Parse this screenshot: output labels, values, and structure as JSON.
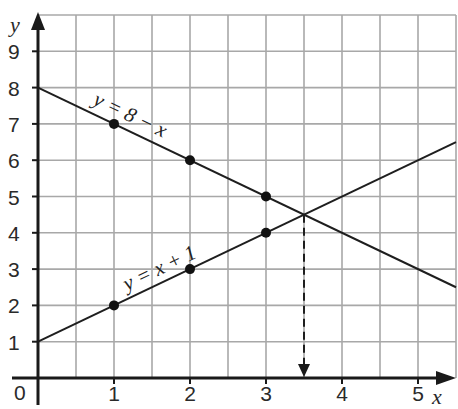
{
  "chart_data": {
    "type": "line",
    "title": "",
    "xlabel": "x",
    "ylabel": "y",
    "xlim": [
      0,
      5.5
    ],
    "ylim": [
      0,
      10
    ],
    "grid": true,
    "x_ticks": [
      "0",
      "1",
      "2",
      "3",
      "4",
      "5"
    ],
    "y_ticks": [
      "1",
      "2",
      "3",
      "4",
      "5",
      "6",
      "7",
      "8",
      "9"
    ],
    "series": [
      {
        "name": "y = 8 − x",
        "label": "y = 8 − x",
        "line": {
          "x": [
            0,
            5.5
          ],
          "y": [
            8,
            2.5
          ]
        },
        "points": [
          {
            "x": 1,
            "y": 7
          },
          {
            "x": 2,
            "y": 6
          },
          {
            "x": 3,
            "y": 5
          }
        ]
      },
      {
        "name": "y = x + 1",
        "label": "y = x + 1",
        "line": {
          "x": [
            0,
            5.5
          ],
          "y": [
            1,
            6.5
          ]
        },
        "points": [
          {
            "x": 1,
            "y": 2
          },
          {
            "x": 2,
            "y": 3
          },
          {
            "x": 3,
            "y": 4
          }
        ]
      }
    ],
    "annotations": [
      {
        "type": "intersection",
        "x": 3.5,
        "y": 4.5
      },
      {
        "type": "dashed-arrow",
        "from": {
          "x": 3.5,
          "y": 4.5
        },
        "to": {
          "x": 3.5,
          "y": 0
        }
      }
    ],
    "legend": "inline labels on lines"
  },
  "labels": {
    "x_axis": "x",
    "y_axis": "y",
    "origin": "0",
    "line1": "y = 8 − x",
    "line2": "y = x + 1"
  },
  "colors": {
    "grid": "#a8a8a8",
    "axis": "#1a1a1a",
    "line": "#1e1e1e",
    "background": "#ffffff"
  }
}
